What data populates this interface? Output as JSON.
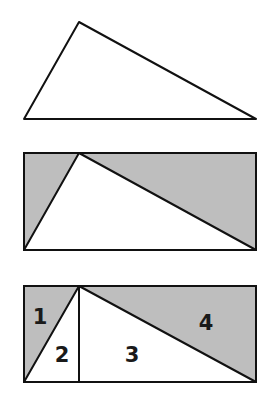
{
  "colors": {
    "stroke": "#111111",
    "shade": "#bebebe",
    "background": "#ffffff"
  },
  "figure1": {
    "description": "triangle",
    "vertices": {
      "apex": [
        79,
        22
      ],
      "bottom_left": [
        24,
        119
      ],
      "bottom_right": [
        256,
        119
      ]
    }
  },
  "figure2": {
    "description": "triangle inscribed in rectangle with shaded remainder",
    "rect": {
      "x": 24,
      "y": 153,
      "width": 232,
      "height": 97
    },
    "apex": [
      79,
      153
    ]
  },
  "figure3": {
    "description": "rectangle divided into four numbered regions",
    "rect": {
      "x": 24,
      "y": 286,
      "width": 232,
      "height": 96
    },
    "apex": [
      79,
      286
    ],
    "labels": [
      {
        "text": "1",
        "x": 40,
        "y": 324
      },
      {
        "text": "2",
        "x": 62,
        "y": 362
      },
      {
        "text": "3",
        "x": 132,
        "y": 362
      },
      {
        "text": "4",
        "x": 206,
        "y": 330
      }
    ]
  }
}
